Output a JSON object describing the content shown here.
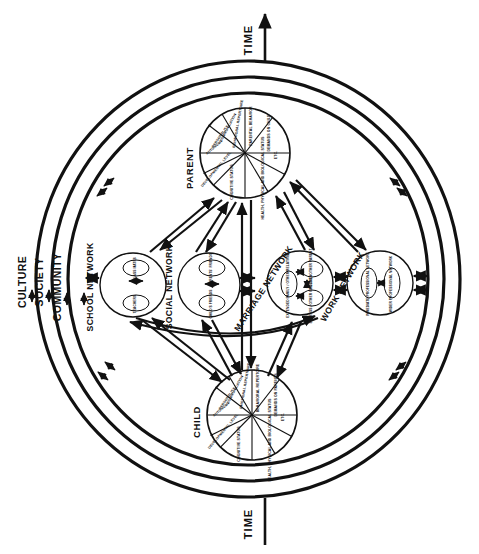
{
  "figure": {
    "time_axis": {
      "top_label": "TIME",
      "bottom_label": "TIME"
    },
    "context_rings": [
      {
        "label": "CULTURE"
      },
      {
        "label": "SOCIETY"
      },
      {
        "label": "COMMUNITY"
      }
    ],
    "hubs": [
      {
        "id": "parent",
        "label": "PARENT",
        "segments": [
          "PARENTAL BEHAVIOR",
          "DEMANDS ON CHILD",
          "ETC.",
          "HEALTH, PHYSICAL AND BIOLOGICAL STATUS",
          "COGNITIVE STATUS",
          "DEVELOPMENTAL LEVEL",
          "AUTONOMY",
          "PERSONALITY",
          "COMMUNICATION",
          "BEHAVIORAL REPERTOIRE"
        ]
      },
      {
        "id": "child",
        "label": "CHILD",
        "segments": [
          "BEHAVIORAL REPERTOIRE",
          "DEMANDS ON PARENTS",
          "ETC.",
          "HEALTH, PHYSICAL AND BIOLOGICAL STATUS",
          "COGNITIVE STATUS",
          "DEVELOPMENTAL LEVEL",
          "AUTONOMY",
          "PERSONALITY",
          "COMMUNICATION",
          "EMOTIONAL REPERTOIRE"
        ]
      }
    ],
    "networks": [
      {
        "id": "school",
        "label": "SCHOOL NETWORK",
        "members": [
          "CLASS MATES",
          "TEACHERS"
        ]
      },
      {
        "id": "social",
        "label": "SOCIAL NETWORK",
        "members": [
          "PARENTS' FRIENDS",
          "CHILD'S FRIENDS"
        ]
      },
      {
        "id": "marriage",
        "label": "MARRIAGE NETWORK",
        "members": [
          "EXTENDED FAMILY / OTHER RELATIVES",
          "SPOUSE / OTHER PARENT",
          "SIBLINGS / OTHER CHILDREN"
        ]
      },
      {
        "id": "work",
        "label": "WORK NETWORK",
        "members": [
          "IMMEDIATE PROFESSIONAL NETWORK",
          "WIDER PROFESSIONAL NETWORK"
        ]
      }
    ],
    "colors": {
      "ink": "#111111",
      "paper": "#ffffff"
    }
  }
}
